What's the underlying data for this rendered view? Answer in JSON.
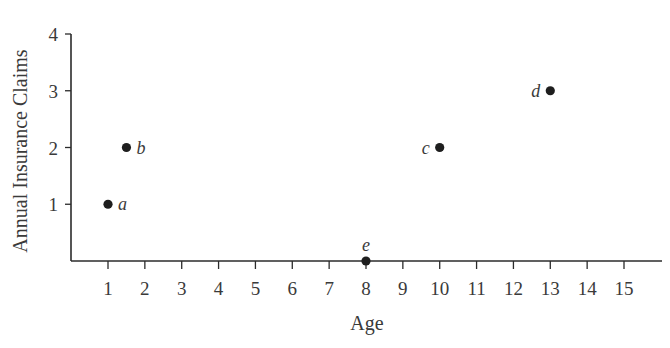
{
  "chart_data": {
    "type": "scatter",
    "title": "",
    "xlabel": "Age",
    "ylabel": "Annual Insurance Claims",
    "xlim": [
      0,
      16
    ],
    "ylim": [
      0,
      4
    ],
    "xticks": [
      1,
      2,
      3,
      4,
      5,
      6,
      7,
      8,
      9,
      10,
      11,
      12,
      13,
      14,
      15
    ],
    "yticks": [
      1,
      2,
      3,
      4
    ],
    "grid": false,
    "legend": null,
    "points": [
      {
        "label": "a",
        "x": 1,
        "y": 1,
        "label_pos": "right"
      },
      {
        "label": "b",
        "x": 1.5,
        "y": 2,
        "label_pos": "right"
      },
      {
        "label": "c",
        "x": 10,
        "y": 2,
        "label_pos": "left"
      },
      {
        "label": "d",
        "x": 13,
        "y": 3,
        "label_pos": "left"
      },
      {
        "label": "e",
        "x": 8,
        "y": 0,
        "label_pos": "above"
      }
    ],
    "colors": {
      "axis": "#2b2b2b",
      "point": "#1e1e1e",
      "text": "#3a3a3a"
    }
  }
}
